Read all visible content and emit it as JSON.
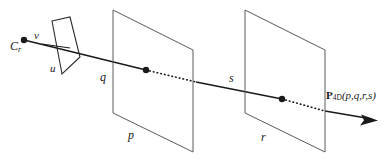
{
  "figure": {
    "background_color": "#ffffff",
    "stroke_color": "#1a1a1a",
    "labels": {
      "camera_center": "C",
      "camera_center_sub": "r",
      "axis_v": "v",
      "axis_u": "u",
      "plane1_vertical": "q",
      "plane1_horizontal": "p",
      "plane2_vertical": "s",
      "plane2_horizontal": "r",
      "ray_point_main": "P",
      "ray_point_sub": "4D",
      "ray_point_args": "(p,q,r,s)"
    },
    "geometry": {
      "camera_plane_quad": "51,21 70,17 80,56 61,74",
      "plane1_quad": "113,10 193,50 193,152 113,113",
      "plane2_quad": "245,10 325,50 325,152 245,113",
      "ray_start": "24,40",
      "ray_end": "377,120",
      "dot1": "146,70",
      "dot2": "282,99",
      "camera_dot": "24,40"
    }
  }
}
